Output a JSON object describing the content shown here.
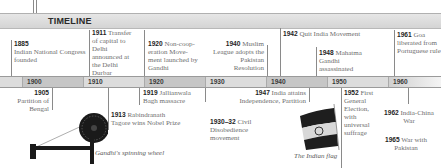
{
  "header": {
    "title": "TIMELINE"
  },
  "top_events": [
    {
      "year": "1885",
      "text": "Indian National Congress founded"
    },
    {
      "year": "1911",
      "text": "Transfer of capital to Delhi announced at the Delhi Durbar"
    },
    {
      "year": "1920",
      "text": "Non-coop-eration Move-ment launched by Gandhi"
    },
    {
      "year": "1940",
      "text": "Muslim League adopts the Pakistan Resolution"
    },
    {
      "year": "1942",
      "text": "Quit India Movement"
    },
    {
      "year": "1948",
      "text": "Mahatma Gandhi assassinated"
    },
    {
      "year": "1961",
      "text": "Goa liberated from Portuguese rule"
    }
  ],
  "decades": [
    "1900",
    "1910",
    "1920",
    "1930",
    "1940",
    "1950",
    "1960"
  ],
  "bottom_events": [
    {
      "year": "1905",
      "text": "Partition of Bengal"
    },
    {
      "year": "1913",
      "text": "Rabindranath Tagore wins Nobel Prize"
    },
    {
      "year": "1919",
      "text": "Jallianwala Bagh massacre"
    },
    {
      "year": "1930–32",
      "text": "Civil Disobedience movement"
    },
    {
      "year": "1947",
      "text": "India attains Independence, Partition"
    },
    {
      "year": "1952",
      "text": "First General Election, with universal suffrage"
    },
    {
      "year": "1962",
      "text": "India-China War"
    },
    {
      "year": "1965",
      "text": "War with Pakistan"
    }
  ],
  "images": [
    {
      "icon": "spinning-wheel-icon",
      "caption": "Gandhi's spinning wheel"
    },
    {
      "icon": "indian-flag-icon",
      "caption": "The Indian flag"
    }
  ],
  "colors": {
    "bar_dark": "#c4c4c4",
    "bar_light": "#dcdcdc",
    "saffron": "#3a3a3a",
    "green": "#1a1a1a"
  }
}
